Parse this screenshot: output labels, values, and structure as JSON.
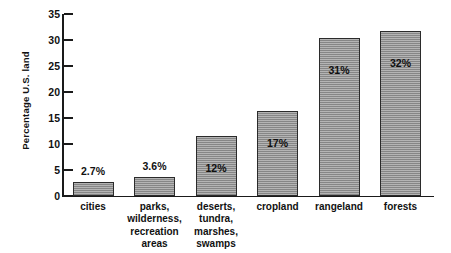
{
  "chart_data": {
    "type": "bar",
    "title": "",
    "subtitle": "",
    "xlabel": "",
    "ylabel": "Percentage U.S. land",
    "ylim": [
      0,
      35
    ],
    "ytick_step": 5,
    "yticks": [
      "35",
      "30",
      "25",
      "20",
      "15",
      "10",
      "5",
      "0"
    ],
    "grid": false,
    "legend": null,
    "categories": [
      "cities",
      "parks, wilderness, recreation areas",
      "deserts, tundra, marshes, swamps",
      "cropland",
      "rangeland",
      "forests"
    ],
    "category_lines": [
      [
        "cities"
      ],
      [
        "parks,",
        "wilderness,",
        "recreation",
        "areas"
      ],
      [
        "deserts,",
        "tundra,",
        "marshes,",
        "swamps"
      ],
      [
        "cropland"
      ],
      [
        "rangeland"
      ],
      [
        "forests"
      ]
    ],
    "values": [
      2.7,
      3.6,
      11.5,
      16.4,
      30.4,
      31.7
    ],
    "data_labels": [
      "2.7%",
      "3.6%",
      "12%",
      "17%",
      "31%",
      "32%"
    ],
    "data_label_position": [
      "above",
      "above",
      "inside",
      "inside",
      "inside",
      "inside"
    ],
    "bar_color": "#8e8e8e",
    "bar_border_color": "#2b2b2b",
    "axis_color": "#1a1a1a",
    "background_color": "#ffffff",
    "text_color": "#111111"
  }
}
